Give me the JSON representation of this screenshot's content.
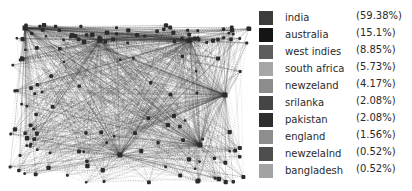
{
  "legend": {
    "items": [
      {
        "label": "india",
        "percent": "(59.38%)",
        "color": "#3c3c3c"
      },
      {
        "label": "australia",
        "percent": "(15.1%)",
        "color": "#151515"
      },
      {
        "label": "west indies",
        "percent": "(8.85%)",
        "color": "#5e5e5e"
      },
      {
        "label": "south africa",
        "percent": "(5.73%)",
        "color": "#a6a6a6"
      },
      {
        "label": "newzeland",
        "percent": "(4.17%)",
        "color": "#8c8c8c"
      },
      {
        "label": "srilanka",
        "percent": "(2.08%)",
        "color": "#454545"
      },
      {
        "label": "pakistan",
        "percent": "(2.08%)",
        "color": "#2e2e2e"
      },
      {
        "label": "england",
        "percent": "(1.56%)",
        "color": "#8e8e8e"
      },
      {
        "label": "newzelalnd",
        "percent": "(0.52%)",
        "color": "#4e4e4e"
      },
      {
        "label": "bangladesh",
        "percent": "(0.52%)",
        "color": "#a3a3a3"
      }
    ]
  },
  "graph": {
    "type": "network",
    "hubs": [
      {
        "x": 25,
        "y": 28
      },
      {
        "x": 100,
        "y": 40
      },
      {
        "x": 190,
        "y": 40
      },
      {
        "x": 225,
        "y": 95
      },
      {
        "x": 200,
        "y": 145
      },
      {
        "x": 120,
        "y": 155
      }
    ]
  }
}
